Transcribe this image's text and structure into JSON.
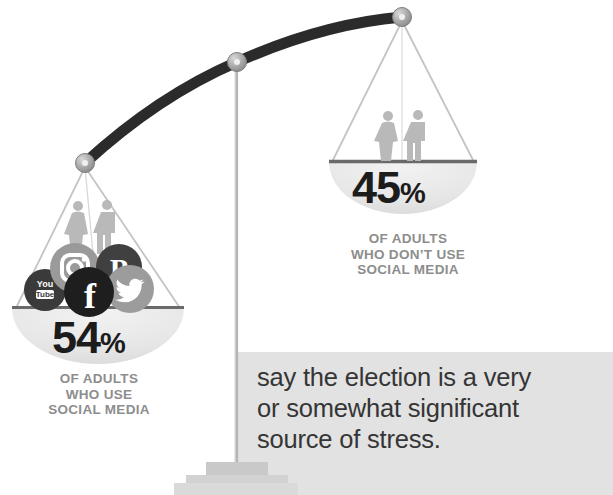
{
  "infographic": {
    "type": "balance-scale",
    "background_color": "#ffffff",
    "statement": {
      "line1": "say the election is a very",
      "line2": "or somewhat significant",
      "line3": "source of stress.",
      "panel_color": "#e2e2e2",
      "text_color": "#353535"
    },
    "pans": {
      "left": {
        "value": "54",
        "symbol": "%",
        "caption_line1": "OF ADULTS",
        "caption_line2": "WHO USE",
        "caption_line3": "SOCIAL MEDIA",
        "icons": [
          {
            "name": "youtube-icon",
            "label_top": "You",
            "label_bottom": "Tube",
            "color": "#3a3a3a"
          },
          {
            "name": "instagram-icon",
            "label": "",
            "color": "#9a9a9a"
          },
          {
            "name": "pinterest-icon",
            "label": "P",
            "color": "#404040"
          },
          {
            "name": "twitter-icon",
            "label": "",
            "color": "#9c9c9c"
          },
          {
            "name": "facebook-icon",
            "label": "f",
            "color": "#1e1e1e"
          }
        ]
      },
      "right": {
        "value": "45",
        "symbol": "%",
        "caption_line1": "OF ADULTS",
        "caption_line2": "WHO DON’T USE",
        "caption_line3": "SOCIAL MEDIA"
      }
    },
    "colors": {
      "beam": "#2b2b2b",
      "knob": "#a8a8a8",
      "pan_bowl": "#e8e8e8",
      "pan_rim": "#6a6a6a",
      "figure": "#b4b4b4",
      "caption": "#8d8d8d",
      "percent": "#1c1c1c",
      "pedestal": "#c9c9c9"
    }
  }
}
